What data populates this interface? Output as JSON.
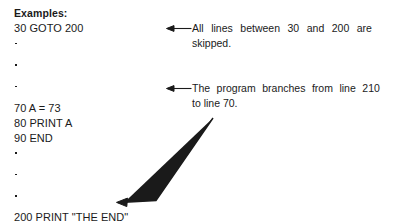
{
  "page": {
    "background_color": "#ffffff",
    "ink_color": "#1a1a1a"
  },
  "listing": {
    "heading": "Examples:",
    "lines": [
      {
        "type": "code",
        "text": "30 GOTO 200"
      },
      {
        "type": "ellipsis",
        "dots": 3
      },
      {
        "type": "code",
        "text": "70 A = 73"
      },
      {
        "type": "code",
        "text": "80 PRINT A"
      },
      {
        "type": "code",
        "text": "90 END"
      },
      {
        "type": "ellipsis",
        "dots": 3
      },
      {
        "type": "code",
        "text": "200 PRINT \"THE END\""
      },
      {
        "type": "code",
        "text": "210 GOTO 70"
      }
    ]
  },
  "annotations": [
    {
      "id": "note-1",
      "arrow_icon": "arrow-left-icon",
      "line1": "All lines between 30 and 200 are",
      "line2": "skipped."
    },
    {
      "id": "note-2",
      "arrow_icon": "arrow-left-icon",
      "line1": "The program branches from line 210",
      "line2": "to line 70."
    }
  ],
  "branch_arrow": {
    "icon": "branch-arrow-icon",
    "description": "elbow arrow pointing to line 210 GOTO 70"
  }
}
